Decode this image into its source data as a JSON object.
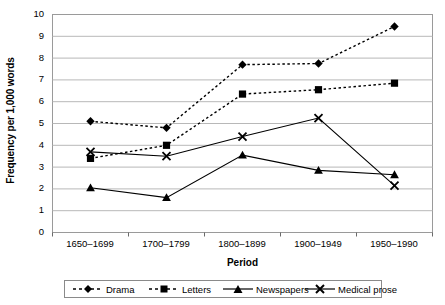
{
  "chart_data": {
    "type": "line",
    "title": "",
    "xlabel": "Period",
    "ylabel": "Frequency per 1,000 words",
    "categories": [
      "1650–1699",
      "1700–1799",
      "1800–1899",
      "1900–1949",
      "1950–1990"
    ],
    "ylim": [
      0,
      10
    ],
    "yticks": [
      "0",
      "1",
      "2",
      "3",
      "4",
      "5",
      "6",
      "7",
      "8",
      "9",
      "10"
    ],
    "grid": "horizontal",
    "legend_position": "bottom",
    "series": [
      {
        "name": "Drama",
        "marker": "diamond",
        "line": "dashed",
        "color": "#000000",
        "values": [
          5.1,
          4.8,
          7.7,
          7.75,
          9.45
        ]
      },
      {
        "name": "Letters",
        "marker": "square",
        "line": "dashed",
        "color": "#000000",
        "values": [
          3.4,
          4.0,
          6.35,
          6.55,
          6.85
        ]
      },
      {
        "name": "Newspapers",
        "marker": "triangle",
        "line": "solid",
        "color": "#000000",
        "values": [
          2.05,
          1.6,
          3.55,
          2.85,
          2.65
        ]
      },
      {
        "name": "Medical prose",
        "marker": "x",
        "line": "solid",
        "color": "#000000",
        "values": [
          3.7,
          3.5,
          4.4,
          5.25,
          2.15
        ]
      }
    ]
  },
  "axis": {
    "y_title": "Frequency per 1,000 words",
    "x_title": "Period"
  },
  "yticks": {
    "t0": "0",
    "t1": "1",
    "t2": "2",
    "t3": "3",
    "t4": "4",
    "t5": "5",
    "t6": "6",
    "t7": "7",
    "t8": "8",
    "t9": "9",
    "t10": "10"
  },
  "xticks": {
    "p0": "1650–1699",
    "p1": "1700–1799",
    "p2": "1800–1899",
    "p3": "1900–1949",
    "p4": "1950–1990"
  },
  "legend": {
    "drama": "Drama",
    "letters": "Letters",
    "newspapers": "Newspapers",
    "medical": "Medical prose"
  }
}
